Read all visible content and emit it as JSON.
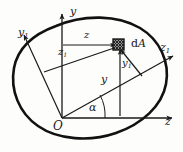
{
  "figure": {
    "kind": "engineering-diagram",
    "background_color": "#fdfdfc",
    "stroke_color": "#1a1a1a",
    "outline_color": "#111111",
    "axes": [
      {
        "id": "z",
        "label": "z",
        "type": "primary-horizontal"
      },
      {
        "id": "y",
        "label": "y",
        "type": "primary-vertical"
      },
      {
        "id": "z1",
        "label": "z",
        "sub": "1",
        "type": "rotated-horizontal"
      },
      {
        "id": "y1",
        "label": "y",
        "sub": "1",
        "type": "rotated-vertical"
      }
    ],
    "dimensions": [
      {
        "id": "z-dim",
        "label": "z",
        "sub": "",
        "meaning": "horizontal distance from y-axis to dA"
      },
      {
        "id": "z1-dim",
        "label": "z",
        "sub": "1",
        "meaning": "distance along rotated z1 direction to dA"
      },
      {
        "id": "y-dim",
        "label": "y",
        "sub": "",
        "meaning": "vertical distance from z-axis to dA"
      },
      {
        "id": "y1-dim",
        "label": "y",
        "sub": "1",
        "meaning": "distance along rotated y1 direction to dA"
      }
    ],
    "angle": {
      "id": "alpha",
      "label": "α",
      "meaning": "rotation angle between z and z1 axes"
    },
    "origin": {
      "label": "O"
    },
    "element": {
      "label_prefix": "d",
      "label_italic": "A",
      "full_label": "dA",
      "style": "cross-hatched-square"
    }
  }
}
